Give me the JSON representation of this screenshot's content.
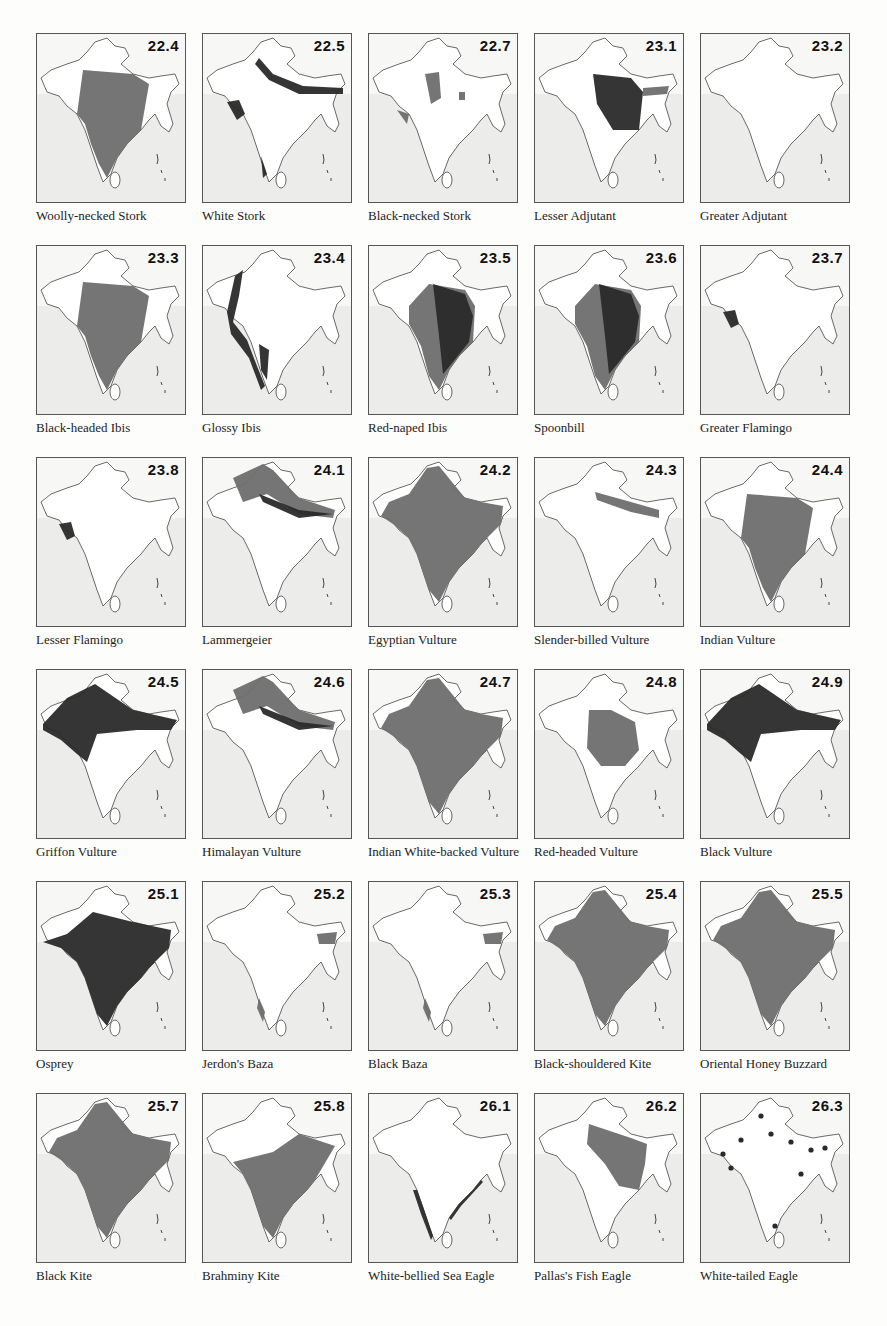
{
  "maps": [
    {
      "num": "22.4",
      "name": "Woolly-necked Stork",
      "fill": "mid"
    },
    {
      "num": "22.5",
      "name": "White Stork",
      "fill": "dark-band"
    },
    {
      "num": "22.7",
      "name": "Black-necked Stork",
      "fill": "patches"
    },
    {
      "num": "23.1",
      "name": "Lesser Adjutant",
      "fill": "dark-central"
    },
    {
      "num": "23.2",
      "name": "Greater Adjutant",
      "fill": "none"
    },
    {
      "num": "23.3",
      "name": "Black-headed Ibis",
      "fill": "mid"
    },
    {
      "num": "23.4",
      "name": "Glossy Ibis",
      "fill": "dark-west"
    },
    {
      "num": "23.5",
      "name": "Red-naped Ibis",
      "fill": "mid-dark"
    },
    {
      "num": "23.6",
      "name": "Spoonbill",
      "fill": "mid-dark"
    },
    {
      "num": "23.7",
      "name": "Greater Flamingo",
      "fill": "dark-gujarat"
    },
    {
      "num": "23.8",
      "name": "Lesser Flamingo",
      "fill": "dark-gujarat"
    },
    {
      "num": "24.1",
      "name": "Lammergeier",
      "fill": "himalaya"
    },
    {
      "num": "24.2",
      "name": "Egyptian Vulture",
      "fill": "mid-full"
    },
    {
      "num": "24.3",
      "name": "Slender-billed Vulture",
      "fill": "himalaya-mid"
    },
    {
      "num": "24.4",
      "name": "Indian Vulture",
      "fill": "mid"
    },
    {
      "num": "24.5",
      "name": "Griffon Vulture",
      "fill": "dark-north"
    },
    {
      "num": "24.6",
      "name": "Himalayan Vulture",
      "fill": "himalaya"
    },
    {
      "num": "24.7",
      "name": "Indian White-backed Vulture",
      "fill": "mid-full"
    },
    {
      "num": "24.8",
      "name": "Red-headed Vulture",
      "fill": "mid-central"
    },
    {
      "num": "24.9",
      "name": "Black Vulture",
      "fill": "dark-north"
    },
    {
      "num": "25.1",
      "name": "Osprey",
      "fill": "dark-full"
    },
    {
      "num": "25.2",
      "name": "Jerdon's Baza",
      "fill": "ne-sw"
    },
    {
      "num": "25.3",
      "name": "Black Baza",
      "fill": "ne-sw"
    },
    {
      "num": "25.4",
      "name": "Black-shouldered Kite",
      "fill": "mid-full"
    },
    {
      "num": "25.5",
      "name": "Oriental Honey Buzzard",
      "fill": "mid-full"
    },
    {
      "num": "25.7",
      "name": "Black Kite",
      "fill": "mid-full"
    },
    {
      "num": "25.8",
      "name": "Brahminy Kite",
      "fill": "mid-south"
    },
    {
      "num": "26.1",
      "name": "White-bellied Sea Eagle",
      "fill": "coast"
    },
    {
      "num": "26.2",
      "name": "Pallas's Fish Eagle",
      "fill": "mid-north"
    },
    {
      "num": "26.3",
      "name": "White-tailed Eagle",
      "fill": "dots"
    }
  ]
}
